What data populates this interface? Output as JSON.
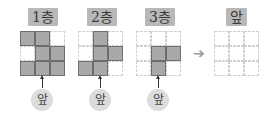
{
  "layers": [
    {
      "label": "1층",
      "cells": [
        1,
        1,
        0,
        0,
        1,
        1,
        1,
        1,
        1
      ],
      "front_label": "앞"
    },
    {
      "label": "2층",
      "cells": [
        0,
        1,
        0,
        0,
        1,
        1,
        1,
        1,
        0
      ],
      "front_label": "앞"
    },
    {
      "label": "3층",
      "cells": [
        0,
        0,
        0,
        0,
        1,
        1,
        0,
        1,
        0
      ],
      "front_label": "앞"
    }
  ],
  "arrow": "➔",
  "result": {
    "label": "앞",
    "cells": [
      0,
      0,
      0,
      0,
      0,
      0,
      0,
      0,
      0
    ]
  },
  "colors": {
    "filled": "#a9a9a9",
    "label_bg": "#b8b8b8"
  }
}
